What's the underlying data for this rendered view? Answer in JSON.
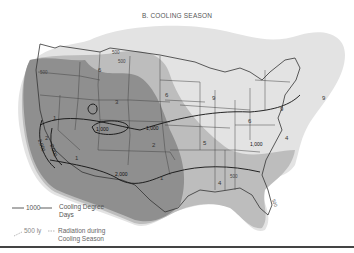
{
  "title": "B. COOLING SEASON",
  "contours": [
    {
      "label": "1,000",
      "kind": "cooling_degree_days"
    },
    {
      "label": "1,000",
      "kind": "cooling_degree_days"
    },
    {
      "label": "2,000",
      "kind": "cooling_degree_days"
    },
    {
      "label": "1,000",
      "kind": "cooling_degree_days"
    },
    {
      "label": "2,000",
      "kind": "cooling_degree_days"
    },
    {
      "label": "2,000",
      "kind": "cooling_degree_days"
    }
  ],
  "radiation_labels": [
    "500",
    "500",
    "500",
    "500",
    "500"
  ],
  "zone_numbers": [
    "6",
    "6",
    "3",
    "2",
    "1",
    "2",
    "5",
    "4",
    "9",
    "9",
    "6",
    "9",
    "4",
    "1",
    "1"
  ],
  "legend": {
    "degree_days_symbol": "1000",
    "degree_days_text_line1": "Cooling Degree",
    "degree_days_text_line2": "Days",
    "radiation_symbol": "500 ly",
    "radiation_text_line1": "Radiation during",
    "radiation_text_line2": "Cooling Season"
  },
  "colors": {
    "light_zone": "#dcdcdc",
    "mid_zone": "#b8b8b8",
    "dark_zone": "#8e8e8e",
    "border": "#333333"
  }
}
